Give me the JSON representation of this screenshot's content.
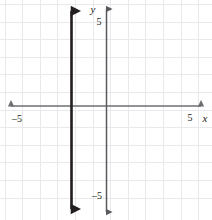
{
  "figure": {
    "kind": "coordinate-plane-graph",
    "width": 212,
    "height": 220,
    "background_color": "#ffffff"
  },
  "grid": {
    "show": true,
    "color": "#e8e8ec",
    "minor_color": "#f1f1f4",
    "spacing_px": 17.6,
    "x_lines": [
      -5.5,
      -4.5,
      -3.5,
      -2.5,
      -1.5,
      -0.5,
      0.5,
      1.5,
      2.5,
      3.5,
      4.5,
      5.5
    ],
    "y_lines": [
      -5.5,
      -4.5,
      -3.5,
      -2.5,
      -1.5,
      -0.5,
      0.5,
      1.5,
      2.5,
      3.5,
      4.5,
      5.5
    ]
  },
  "axes": {
    "color": "#6d6e71",
    "x_axis": {
      "name": "x-axis",
      "label": "x",
      "min": -6,
      "max": 6,
      "arrowheads": "both",
      "tick_labels": [
        {
          "value": -5,
          "text": "–5"
        },
        {
          "value": 5,
          "text": "5"
        }
      ]
    },
    "y_axis": {
      "name": "y-axis",
      "label": "y",
      "min": -6,
      "max": 6,
      "arrowheads": "both",
      "color": "#58595b",
      "tick_labels": [
        {
          "value": 5,
          "text": "5"
        },
        {
          "value": -5,
          "text": "–5"
        }
      ]
    },
    "origin": {
      "x": 0,
      "y": 0
    }
  },
  "plotted_lines": [
    {
      "name": "vertical-line-x-equals-negative-2",
      "equation": "x = -2",
      "type": "vertical",
      "x_intercept": -2,
      "color": "#231f20",
      "stroke_width": 3,
      "arrowheads": "both",
      "extends_from_y": -6,
      "extends_to_y": 6
    }
  ]
}
